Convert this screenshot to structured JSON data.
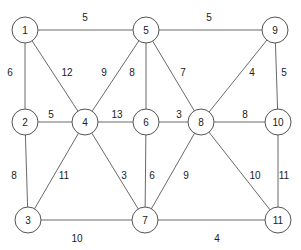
{
  "diagram": {
    "type": "weighted-undirected-graph",
    "nodes": [
      {
        "id": "1",
        "label": "1"
      },
      {
        "id": "2",
        "label": "2"
      },
      {
        "id": "3",
        "label": "3"
      },
      {
        "id": "4",
        "label": "4"
      },
      {
        "id": "5",
        "label": "5"
      },
      {
        "id": "6",
        "label": "6"
      },
      {
        "id": "7",
        "label": "7"
      },
      {
        "id": "8",
        "label": "8"
      },
      {
        "id": "9",
        "label": "9"
      },
      {
        "id": "10",
        "label": "10"
      },
      {
        "id": "11",
        "label": "11"
      }
    ],
    "edges": [
      {
        "from": "1",
        "to": "5",
        "weight": "5"
      },
      {
        "from": "5",
        "to": "9",
        "weight": "5"
      },
      {
        "from": "1",
        "to": "2",
        "weight": "6"
      },
      {
        "from": "1",
        "to": "4",
        "weight": "12"
      },
      {
        "from": "5",
        "to": "4",
        "weight": "9"
      },
      {
        "from": "5",
        "to": "6",
        "weight": "8"
      },
      {
        "from": "5",
        "to": "8",
        "weight": "7"
      },
      {
        "from": "9",
        "to": "8",
        "weight": "4"
      },
      {
        "from": "9",
        "to": "10",
        "weight": "5"
      },
      {
        "from": "2",
        "to": "4",
        "weight": "5"
      },
      {
        "from": "4",
        "to": "6",
        "weight": "13"
      },
      {
        "from": "6",
        "to": "8",
        "weight": "3"
      },
      {
        "from": "8",
        "to": "10",
        "weight": "8"
      },
      {
        "from": "2",
        "to": "3",
        "weight": "8"
      },
      {
        "from": "4",
        "to": "3",
        "weight": "11"
      },
      {
        "from": "4",
        "to": "7",
        "weight": "3"
      },
      {
        "from": "6",
        "to": "7",
        "weight": "6"
      },
      {
        "from": "8",
        "to": "7",
        "weight": "9"
      },
      {
        "from": "8",
        "to": "11",
        "weight": "10"
      },
      {
        "from": "10",
        "to": "11",
        "weight": "11"
      },
      {
        "from": "3",
        "to": "7",
        "weight": "10"
      },
      {
        "from": "7",
        "to": "11",
        "weight": "4"
      }
    ]
  }
}
